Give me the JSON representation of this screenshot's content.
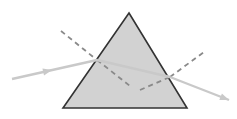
{
  "figure": {
    "width": 237,
    "height": 119,
    "background_color": "#ffffff"
  },
  "colors": {
    "prism_fill": "#d2d2d2",
    "prism_stroke": "#333333",
    "ray_color": "#c9c9c9",
    "normal_dash_color": "#8a8a8a"
  },
  "prism": {
    "name": "triangular-prism",
    "shape": "equilateral-triangle",
    "apex": {
      "x": 129,
      "y": 13
    },
    "bottom_left": {
      "x": 63,
      "y": 108
    },
    "bottom_right": {
      "x": 187,
      "y": 108
    },
    "fill": "#d2d2d2",
    "stroke": "#333333",
    "stroke_width": 1.6
  },
  "rays": [
    {
      "name": "incident-ray",
      "label": "Incident ray",
      "from": {
        "x": 12,
        "y": 79
      },
      "to": {
        "x": 97,
        "y": 60
      },
      "arrow_at": {
        "x": 52,
        "y": 70
      },
      "color": "#c9c9c9",
      "width": 2.4,
      "style": "solid"
    },
    {
      "name": "internal-refracted-ray",
      "label": "Refracted ray inside prism",
      "from": {
        "x": 97,
        "y": 60
      },
      "to": {
        "x": 170,
        "y": 77
      },
      "color": "#c9c9c9",
      "width": 2.4,
      "style": "solid"
    },
    {
      "name": "emergent-ray",
      "label": "Emergent ray",
      "from": {
        "x": 170,
        "y": 77
      },
      "to": {
        "x": 229,
        "y": 100
      },
      "arrow_at": {
        "x": 229,
        "y": 100
      },
      "color": "#c9c9c9",
      "width": 2.4,
      "style": "solid"
    }
  ],
  "normals": [
    {
      "name": "normal-line-entry-outer",
      "label": "Normal at entry face (outside)",
      "from": {
        "x": 61,
        "y": 31
      },
      "to": {
        "x": 97,
        "y": 60
      },
      "color": "#8a8a8a",
      "width": 1.8,
      "style": "dashed",
      "dash_pattern": "5,4"
    },
    {
      "name": "normal-line-entry-inner",
      "label": "Normal at entry face (inside)",
      "from": {
        "x": 97,
        "y": 60
      },
      "to": {
        "x": 130,
        "y": 86
      },
      "color": "#8a8a8a",
      "width": 1.8,
      "style": "dashed",
      "dash_pattern": "5,4"
    },
    {
      "name": "normal-line-exit-inner",
      "label": "Normal at exit face (inside)",
      "from": {
        "x": 140,
        "y": 90
      },
      "to": {
        "x": 170,
        "y": 77
      },
      "color": "#8a8a8a",
      "width": 1.8,
      "style": "dashed",
      "dash_pattern": "5,4"
    },
    {
      "name": "normal-line-exit-outer",
      "label": "Normal at exit face (outside)",
      "from": {
        "x": 170,
        "y": 77
      },
      "to": {
        "x": 204,
        "y": 52
      },
      "color": "#8a8a8a",
      "width": 1.8,
      "style": "dashed",
      "dash_pattern": "5,4"
    }
  ],
  "points": [
    {
      "name": "entry-point",
      "label": "Point of incidence",
      "x": 97,
      "y": 60
    },
    {
      "name": "exit-point",
      "label": "Point of emergence",
      "x": 170,
      "y": 77
    }
  ],
  "annotations": []
}
